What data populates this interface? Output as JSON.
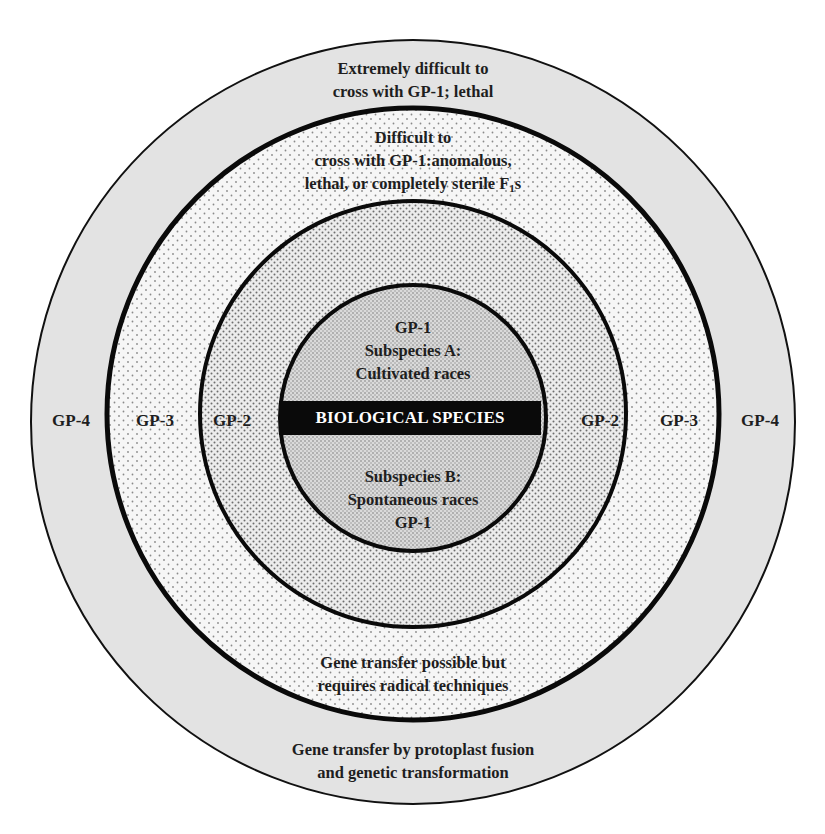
{
  "diagram": {
    "type": "concentric-gene-pool-diagram",
    "colors": {
      "background": "#ffffff",
      "gp4_fill": "#e3e3e3",
      "gp3_fill": "#f4f4f4",
      "gp2_fill": "#e6e6e6",
      "gp1_fill": "#d2d2d2",
      "ring_stroke": "#0a0a0a",
      "species_bar": "#0a0a0a",
      "species_bar_text": "#ffffff",
      "text": "#1e1e1e"
    },
    "rings": {
      "gp4": {
        "label_left": "GP-4",
        "label_right": "GP-4",
        "top_text": [
          "Extremely difficult to",
          "cross with GP-1; lethal"
        ],
        "bottom_text": [
          "Gene transfer by protoplast fusion",
          "and genetic transformation"
        ]
      },
      "gp3": {
        "label_left": "GP-3",
        "label_right": "GP-3",
        "top_text": [
          "Difficult to",
          "cross with GP-1:anomalous,",
          "lethal, or completely sterile F",
          "1",
          "s"
        ],
        "bottom_text": [
          "Gene transfer possible but",
          "requires radical techniques"
        ]
      },
      "gp2": {
        "label_left": "GP-2",
        "label_right": "GP-2"
      },
      "gp1": {
        "top_text": [
          "GP-1",
          "Subspecies A:",
          "Cultivated races"
        ],
        "center_label": "BIOLOGICAL SPECIES",
        "bottom_text": [
          "Subspecies B:",
          "Spontaneous races",
          "GP-1"
        ]
      }
    }
  }
}
